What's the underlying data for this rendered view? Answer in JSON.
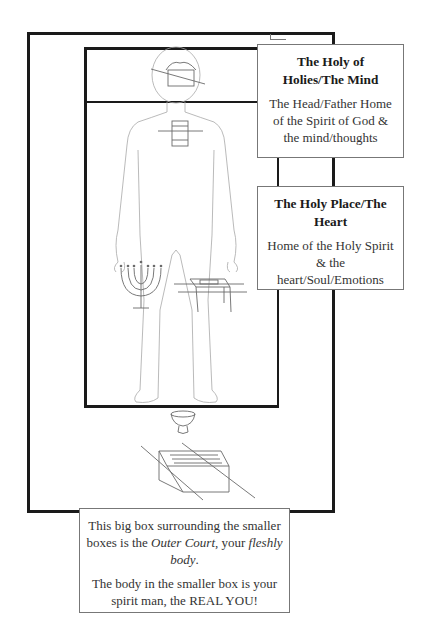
{
  "diagram": {
    "colors": {
      "frame": "#1a1a1a",
      "label_border": "#777777",
      "drawing_line": "#9a9a9a",
      "text": "#333333",
      "background": "#ffffff"
    },
    "regions": {
      "outer_court": "Outer Court frame",
      "holy_place": "Holy Place frame",
      "holy_of_holies": "Holy of Holies frame"
    },
    "labels": {
      "holy_of_holies": {
        "title": "The Holy of Holies/The Mind",
        "body": "The Head/Father Home of the Spirit of God & the mind/thoughts"
      },
      "holy_place": {
        "title": "The Holy Place/The Heart",
        "body": "Home of the Holy Spirit & the heart/Soul/Emotions"
      },
      "outer_court": {
        "line1_pre": "This big box surrounding the smaller boxes is the ",
        "line1_em": "Outer Court",
        "line1_mid": ", your ",
        "line1_em2": "fleshly body",
        "line1_post": ".",
        "line2": "The body in the smaller box is your spirit man, the REAL YOU!"
      }
    },
    "illustrations": [
      "ark-of-covenant-icon",
      "altar-of-incense-icon",
      "menorah-icon",
      "table-of-showbread-icon",
      "laver-icon",
      "brazen-altar-icon",
      "human-figure-outline"
    ]
  }
}
